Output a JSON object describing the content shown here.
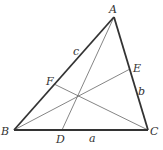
{
  "diagram": {
    "colors": {
      "stroke": "#333333",
      "thin": "#666666",
      "background": "#ffffff"
    },
    "vertices": {
      "A": {
        "label": "A",
        "x": 114,
        "y": 17
      },
      "B": {
        "label": "B",
        "x": 14,
        "y": 130
      },
      "C": {
        "label": "C",
        "x": 148,
        "y": 130
      }
    },
    "feet": {
      "D": {
        "label": "D",
        "x": 62,
        "y": 130
      },
      "E": {
        "label": "E",
        "x": 130,
        "y": 69
      },
      "F": {
        "label": "F",
        "x": 54,
        "y": 84
      }
    },
    "side_labels": {
      "a": {
        "label": "a",
        "x": 92,
        "y": 142
      },
      "b": {
        "label": "b",
        "x": 139,
        "y": 94
      },
      "c": {
        "label": "c",
        "x": 75,
        "y": 55
      }
    },
    "concurrency_point": {
      "x": 79,
      "y": 96
    }
  }
}
